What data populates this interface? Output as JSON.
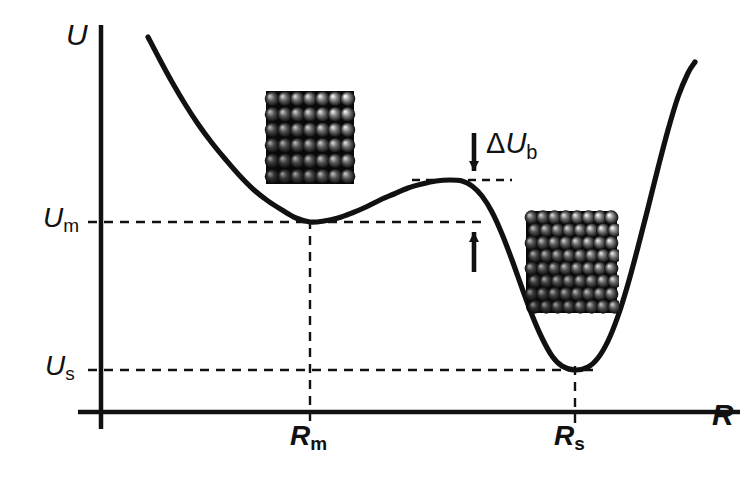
{
  "figure": {
    "kind": "potential-energy-curve",
    "background_color": "#ffffff",
    "ink_color": "#111111"
  },
  "axes": {
    "y_label": "U",
    "x_label": "R",
    "y_axis_name": "potential-energy-axis",
    "x_axis_name": "cluster-radius-axis"
  },
  "tick_labels": {
    "u_m": {
      "symbol": "U",
      "subscript": "m"
    },
    "u_s": {
      "symbol": "U",
      "subscript": "s"
    },
    "r_m": {
      "symbol": "R",
      "subscript": "m"
    },
    "r_s": {
      "symbol": "R",
      "subscript": "s"
    }
  },
  "annotations": {
    "barrier": {
      "delta": "Δ",
      "symbol": "U",
      "subscript": "b"
    }
  },
  "clusters": {
    "metastable": {
      "name": "cubic-crystalline-cluster",
      "rows": 6,
      "cols": 7
    },
    "stable": {
      "name": "larger-crystalline-cluster",
      "rows": 8,
      "cols": 8
    }
  },
  "chart_data": {
    "type": "line",
    "title": "",
    "xlabel": "R",
    "ylabel": "U",
    "grid": false,
    "legend": null,
    "xlim": [
      0,
      1
    ],
    "ylim": [
      0,
      1
    ],
    "x_ticks": [
      {
        "label": "R_m",
        "px": 310
      },
      {
        "label": "R_s",
        "px": 575
      }
    ],
    "y_ticks": [
      {
        "label": "U_m",
        "px": 222
      },
      {
        "label": "U_s",
        "px": 370
      }
    ],
    "features": {
      "local_minimum_metastable": {
        "x_label": "R_m",
        "y_label": "U_m",
        "x_px": 310,
        "y_px": 222
      },
      "barrier_maximum": {
        "x_px": 455,
        "y_px": 180
      },
      "global_minimum_stable": {
        "x_label": "R_s",
        "y_label": "U_s",
        "x_px": 575,
        "y_px": 370
      },
      "barrier_height_label": "ΔU_b"
    },
    "curve_points_px": [
      [
        148,
        37
      ],
      [
        160,
        60
      ],
      [
        172,
        82
      ],
      [
        185,
        104
      ],
      [
        198,
        124
      ],
      [
        212,
        143
      ],
      [
        226,
        160
      ],
      [
        240,
        176
      ],
      [
        254,
        190
      ],
      [
        268,
        201
      ],
      [
        282,
        210
      ],
      [
        296,
        218
      ],
      [
        310,
        222
      ],
      [
        324,
        221
      ],
      [
        338,
        218
      ],
      [
        352,
        213
      ],
      [
        366,
        207
      ],
      [
        380,
        200
      ],
      [
        394,
        194
      ],
      [
        408,
        188
      ],
      [
        422,
        184
      ],
      [
        436,
        181
      ],
      [
        450,
        180
      ],
      [
        462,
        181
      ],
      [
        472,
        186
      ],
      [
        482,
        196
      ],
      [
        492,
        212
      ],
      [
        502,
        234
      ],
      [
        512,
        260
      ],
      [
        522,
        288
      ],
      [
        532,
        315
      ],
      [
        542,
        338
      ],
      [
        552,
        356
      ],
      [
        562,
        366
      ],
      [
        575,
        370
      ],
      [
        588,
        367
      ],
      [
        598,
        358
      ],
      [
        608,
        341
      ],
      [
        618,
        316
      ],
      [
        628,
        284
      ],
      [
        638,
        247
      ],
      [
        648,
        208
      ],
      [
        658,
        168
      ],
      [
        668,
        130
      ],
      [
        678,
        97
      ],
      [
        688,
        73
      ],
      [
        695,
        62
      ]
    ],
    "dashed_guides": [
      {
        "name": "u-m-level",
        "orientation": "horizontal",
        "y_px": 222,
        "x_from": 88,
        "x_to": 487
      },
      {
        "name": "u-s-level",
        "orientation": "horizontal",
        "y_px": 370,
        "x_from": 88,
        "x_to": 600
      },
      {
        "name": "barrier-level",
        "orientation": "horizontal",
        "y_px": 180,
        "x_from": 412,
        "x_to": 512
      },
      {
        "name": "r-m-position",
        "orientation": "vertical",
        "x_px": 310,
        "y_from": 220,
        "y_to": 424
      },
      {
        "name": "r-s-position",
        "orientation": "vertical",
        "x_px": 575,
        "y_from": 366,
        "y_to": 424
      }
    ],
    "arrows": [
      {
        "name": "barrier-top-arrow",
        "direction": "down",
        "x_px": 474,
        "y_from": 133,
        "y_to": 180
      },
      {
        "name": "barrier-bottom-arrow",
        "direction": "up",
        "x_px": 474,
        "y_from": 272,
        "y_to": 222
      }
    ]
  }
}
